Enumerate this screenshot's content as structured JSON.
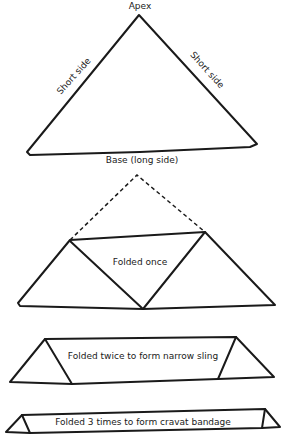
{
  "diagram": {
    "figure1": {
      "apex_label": "Apex",
      "left_side_label": "Short side",
      "right_side_label": "Short side",
      "base_label": "Base (long side)"
    },
    "figure2": {
      "label": "Folded once"
    },
    "figure3": {
      "label": "Folded twice to form narrow sling"
    },
    "figure4": {
      "label": "Folded 3 times to form cravat bandage"
    },
    "colors": {
      "line": "#1a1a1a",
      "background": "#ffffff"
    }
  }
}
